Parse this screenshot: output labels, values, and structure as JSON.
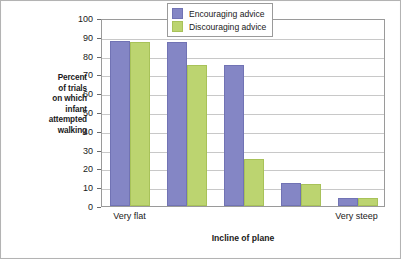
{
  "chart_data": {
    "type": "bar",
    "title": "",
    "xlabel": "Incline of plane",
    "ylabel": "Percent of trials on which infant attempted walking",
    "ylabel_lines": [
      "Percent",
      "of trials",
      "on which",
      "infant",
      "attempted",
      "walking"
    ],
    "categories": [
      "Very flat",
      "",
      "",
      "",
      "Very steep"
    ],
    "x_tick_labels": [
      "Very flat",
      "Very steep"
    ],
    "series": [
      {
        "name": "Encouraging advice",
        "color": "#8486c5",
        "values": [
          88,
          87,
          75,
          12,
          4.5
        ]
      },
      {
        "name": "Discouraging advice",
        "color": "#bcd470",
        "values": [
          87,
          75,
          25,
          11.5,
          4.5
        ]
      }
    ],
    "y_ticks": [
      0,
      10,
      20,
      30,
      40,
      50,
      60,
      70,
      80,
      90,
      100
    ],
    "ylim": [
      0,
      100
    ],
    "grid": true,
    "legend_position": "top-right"
  },
  "legend": {
    "items": [
      {
        "label": "Encouraging advice",
        "color": "#8486c5"
      },
      {
        "label": "Discouraging advice",
        "color": "#bcd470"
      }
    ]
  },
  "axes": {
    "x_title": "Incline of plane",
    "y_title_lines": [
      "Percent",
      "of trials",
      "on which",
      "infant",
      "attempted",
      "walking"
    ],
    "y_tick_labels": [
      "100",
      "90",
      "80",
      "70",
      "60",
      "50",
      "40",
      "30",
      "20",
      "10",
      "0"
    ],
    "x_tick_labels": [
      "Very flat",
      "Very steep"
    ]
  }
}
